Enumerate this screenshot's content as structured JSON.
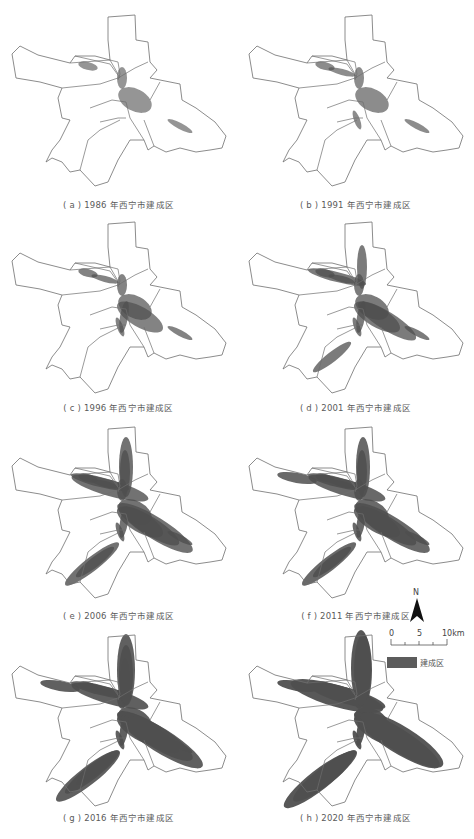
{
  "figure": {
    "panels": [
      {
        "id": "a",
        "caption": "( a ) 1986 年西宁市建成区",
        "year": 1986,
        "stage": 1
      },
      {
        "id": "b",
        "caption": "( b ) 1991 年西宁市建成区",
        "year": 1991,
        "stage": 2
      },
      {
        "id": "c",
        "caption": "( c ) 1996 年西宁市建成区",
        "year": 1996,
        "stage": 3
      },
      {
        "id": "d",
        "caption": "( d ) 2001 年西宁市建成区",
        "year": 2001,
        "stage": 4
      },
      {
        "id": "e",
        "caption": "( e ) 2006 年西宁市建成区",
        "year": 2006,
        "stage": 5
      },
      {
        "id": "f",
        "caption": "( f ) 2011 年西宁市建成区",
        "year": 2011,
        "stage": 6
      },
      {
        "id": "g",
        "caption": "( g ) 2016 年西宁市建成区",
        "year": 2016,
        "stage": 7
      },
      {
        "id": "h",
        "caption": "( h ) 2020 年西宁市建成区",
        "year": 2020,
        "stage": 8
      }
    ],
    "legend": {
      "north_label": "N",
      "scale_labels": [
        "0",
        "5",
        "10km"
      ],
      "swatch_label": "建成区",
      "swatch_color": "#5c5c5c"
    },
    "colors": {
      "boundary": "#6e6e6e",
      "built_up": "#4f4f4f",
      "background": "#ffffff"
    }
  }
}
